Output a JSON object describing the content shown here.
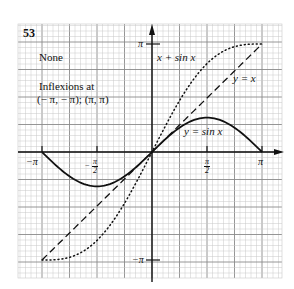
{
  "problem_number": "53",
  "notes": {
    "asymptotes": "None",
    "inflections_label": "Inflexions at",
    "inflections_points": "(− π, − π); (π, π)"
  },
  "axis_labels": {
    "x_neg_pi": "−π",
    "x_neg_half_pi_num": "π",
    "x_neg_half_pi_sign": "−",
    "x_neg_half_pi_den": "2",
    "x_half_pi_num": "π",
    "x_half_pi_den": "2",
    "x_pi": "π",
    "y_pi": "π",
    "y_neg_pi": "−π"
  },
  "curve_labels": {
    "x_plus_sin": "x + sin  x",
    "y_eq_x": "y = x",
    "y_eq_sinx": "y = sin x"
  },
  "colors": {
    "ink": "#111111",
    "grid_minor": "#c8c8c8",
    "grid_major": "#8a8a8a",
    "paper": "#ffffff"
  },
  "chart_data": {
    "type": "line",
    "title": "",
    "xlabel": "",
    "ylabel": "",
    "xlim": [
      -3.1416,
      3.1416
    ],
    "ylim": [
      -3.1416,
      3.1416
    ],
    "grid": true,
    "x_ticks": [
      "-π",
      "-π/2",
      "π/2",
      "π"
    ],
    "y_ticks": [
      "π",
      "-π"
    ],
    "series": [
      {
        "name": "y = sin x",
        "style": "solid",
        "x": [
          -3.1416,
          -2.3562,
          -1.5708,
          -0.7854,
          0,
          0.7854,
          1.5708,
          2.3562,
          3.1416
        ],
        "y": [
          0,
          -0.7071,
          -1,
          -0.7071,
          0,
          0.7071,
          1,
          0.7071,
          0
        ]
      },
      {
        "name": "y = x",
        "style": "dashed",
        "x": [
          -3.1416,
          3.1416
        ],
        "y": [
          -3.1416,
          3.1416
        ]
      },
      {
        "name": "x + sin x",
        "style": "dotted",
        "x": [
          -3.1416,
          -2.3562,
          -1.5708,
          -0.7854,
          0,
          0.7854,
          1.5708,
          2.3562,
          3.1416
        ],
        "y": [
          -3.1416,
          -3.0633,
          -2.5708,
          -1.4925,
          0,
          1.4925,
          2.5708,
          3.0633,
          3.1416
        ]
      }
    ],
    "annotations": [
      "None",
      "Inflexions at (−π, −π); (π, π)"
    ]
  }
}
